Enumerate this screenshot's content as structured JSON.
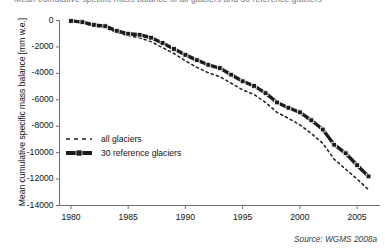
{
  "figure": {
    "clipped_caption": "Mean cumulative specific mass balance of all glaciers and 30 reference glaciers",
    "source": "Source: WGMS 2008a"
  },
  "legend": {
    "position": "inner-left",
    "items": [
      {
        "label": "all glaciers",
        "style": "dashed",
        "key": "dashed-line-key"
      },
      {
        "label": "30 reference glaciers",
        "style": "solid-thick",
        "key": "solid-line-key"
      }
    ]
  },
  "colors": {
    "series": "#1c1c1c",
    "axis": "#6f6f6f",
    "text": "#111111",
    "background": "#ffffff"
  },
  "chart_data": {
    "type": "line",
    "title": "",
    "subtitle": "",
    "xlabel": "",
    "ylabel": "Mean cumulative specific mass balance [mm w.e.]",
    "xlim": [
      1979,
      2007
    ],
    "ylim": [
      -14000,
      0
    ],
    "grid": false,
    "xticks": [
      1980,
      1985,
      1990,
      1995,
      2000,
      2005
    ],
    "yticks": [
      0,
      -2000,
      -4000,
      -6000,
      -8000,
      -10000,
      -12000,
      -14000
    ],
    "ytick_labels": [
      "0",
      "-2000",
      "-4000",
      "-6000",
      "-8000",
      "-10000",
      "-12000",
      "-14000"
    ],
    "xtick_labels": [
      "1980",
      "1985",
      "1990",
      "1995",
      "2000",
      "2005"
    ],
    "x": [
      1980,
      1981,
      1982,
      1983,
      1984,
      1985,
      1986,
      1987,
      1988,
      1989,
      1990,
      1991,
      1992,
      1993,
      1994,
      1995,
      1996,
      1997,
      1998,
      1999,
      2000,
      2001,
      2002,
      2003,
      2004,
      2005,
      2006
    ],
    "series": [
      {
        "name": "all glaciers",
        "style": "dashed",
        "values": [
          -50,
          -180,
          -420,
          -560,
          -900,
          -1150,
          -1300,
          -1600,
          -2050,
          -2500,
          -3050,
          -3550,
          -3950,
          -4250,
          -4750,
          -5250,
          -5600,
          -6200,
          -6950,
          -7400,
          -7900,
          -8550,
          -9300,
          -10500,
          -11250,
          -12000,
          -12800
        ]
      },
      {
        "name": "30 reference glaciers",
        "style": "solid-thick",
        "markers": true,
        "values": [
          -30,
          -120,
          -330,
          -430,
          -780,
          -1000,
          -1080,
          -1300,
          -1700,
          -2150,
          -2600,
          -3000,
          -3350,
          -3600,
          -4100,
          -4600,
          -4950,
          -5500,
          -6200,
          -6600,
          -6950,
          -7550,
          -8250,
          -9400,
          -10050,
          -10950,
          -11800
        ]
      }
    ]
  }
}
